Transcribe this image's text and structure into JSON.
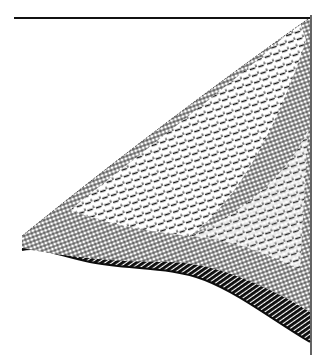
{
  "figure": {
    "kind": "3d-mesh-surface-illustration",
    "style": "black-and-white engraving with dashed grid hatching",
    "colors": {
      "background": "#ffffff",
      "ink": "#111111",
      "shadow": "#0d0d0d"
    },
    "frame": {
      "top_line": {
        "x1": 14,
        "y1": 18,
        "x2": 310,
        "y2": 18
      },
      "right_line": {
        "x1": 311,
        "y1": 15,
        "x2": 311,
        "y2": 355
      }
    }
  }
}
